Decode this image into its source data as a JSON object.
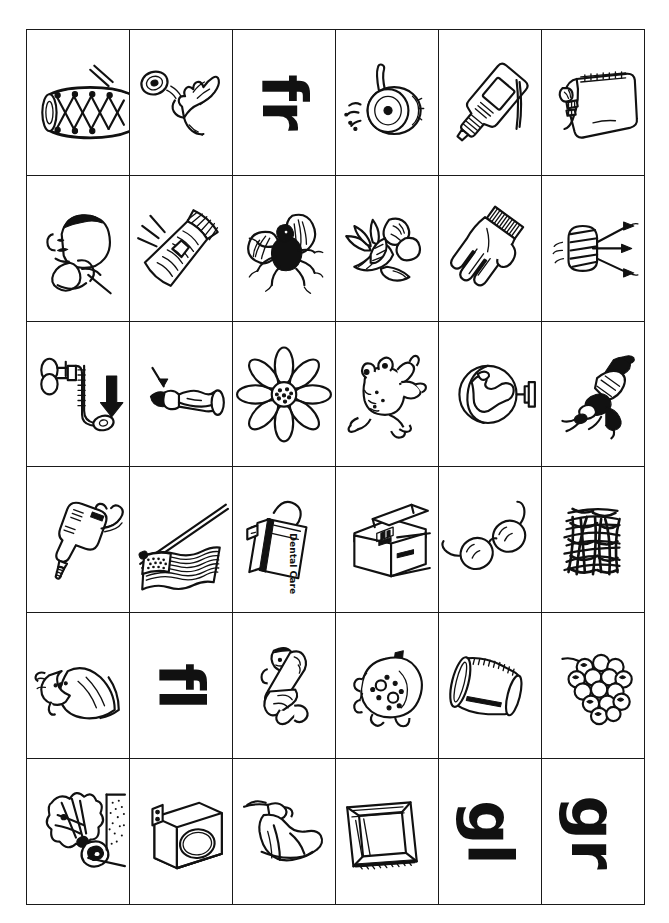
{
  "worksheet": {
    "title": "Phonics Blends Picture Card Grid",
    "columns": 6,
    "rows": 6,
    "ink_color": "#111111",
    "paper_color": "#ffffff",
    "border_color": "#1a1a1a"
  },
  "blend_labels": [
    {
      "text": "fr",
      "row": 1,
      "col": 3,
      "rotation_deg": 90
    },
    {
      "text": "fl",
      "row": 5,
      "col": 2,
      "rotation_deg": 90
    },
    {
      "text": "gl",
      "row": 6,
      "col": 5,
      "rotation_deg": 90
    },
    {
      "text": "gr",
      "row": 6,
      "col": 6,
      "rotation_deg": 90
    }
  ],
  "embedded_text": [
    {
      "text": "Dental Care",
      "location": "row 4 column 3 dental floss box",
      "rotation_deg": 90
    }
  ],
  "cells": [
    {
      "id": "r1c1",
      "row": 1,
      "col": 1,
      "kind": "picture",
      "icon": "drum-icon",
      "label": "drum"
    },
    {
      "id": "r1c2",
      "row": 1,
      "col": 2,
      "kind": "picture",
      "icon": "frisbee-throw-icon",
      "label": "frisbee"
    },
    {
      "id": "r1c3",
      "row": 1,
      "col": 3,
      "kind": "letters",
      "icon": "blend-text-fr",
      "label": "fr"
    },
    {
      "id": "r1c4",
      "row": 1,
      "col": 4,
      "kind": "picture",
      "icon": "frying-pan-icon",
      "label": "frying pan"
    },
    {
      "id": "r1c5",
      "row": 1,
      "col": 5,
      "kind": "picture",
      "icon": "glue-bottle-icon",
      "label": "glue"
    },
    {
      "id": "r1c6",
      "row": 1,
      "col": 6,
      "kind": "picture",
      "icon": "bread-loaf-bag-icon",
      "label": "bread bag"
    },
    {
      "id": "r2c1",
      "row": 2,
      "col": 1,
      "kind": "picture",
      "icon": "frown-boy-icon",
      "label": "frown"
    },
    {
      "id": "r2c2",
      "row": 2,
      "col": 2,
      "kind": "picture",
      "icon": "flashlight-icon",
      "label": "flashlight"
    },
    {
      "id": "r2c3",
      "row": 2,
      "col": 3,
      "kind": "picture",
      "icon": "fly-insect-icon",
      "label": "fly"
    },
    {
      "id": "r2c4",
      "row": 2,
      "col": 4,
      "kind": "picture",
      "icon": "fruit-bowl-icon",
      "label": "fruit"
    },
    {
      "id": "r2c5",
      "row": 2,
      "col": 5,
      "kind": "picture",
      "icon": "glove-icon",
      "label": "glove"
    },
    {
      "id": "r2c6",
      "row": 2,
      "col": 6,
      "kind": "picture",
      "icon": "grill-icon",
      "label": "grill"
    },
    {
      "id": "r3c1",
      "row": 3,
      "col": 1,
      "kind": "picture",
      "icon": "faucet-drain-icon",
      "label": "drain"
    },
    {
      "id": "r3c2",
      "row": 3,
      "col": 2,
      "kind": "picture",
      "icon": "flea-on-finger-icon",
      "label": "flea"
    },
    {
      "id": "r3c3",
      "row": 3,
      "col": 3,
      "kind": "picture",
      "icon": "flower-icon",
      "label": "flower"
    },
    {
      "id": "r3c4",
      "row": 3,
      "col": 4,
      "kind": "picture",
      "icon": "frog-icon",
      "label": "frog"
    },
    {
      "id": "r3c5",
      "row": 3,
      "col": 5,
      "kind": "picture",
      "icon": "globe-icon",
      "label": "globe"
    },
    {
      "id": "r3c6",
      "row": 3,
      "col": 6,
      "kind": "picture",
      "icon": "grasshopper-icon",
      "label": "grasshopper"
    },
    {
      "id": "r4c1",
      "row": 4,
      "col": 1,
      "kind": "picture",
      "icon": "drill-icon",
      "label": "drill"
    },
    {
      "id": "r4c2",
      "row": 4,
      "col": 2,
      "kind": "picture",
      "icon": "flag-icon",
      "label": "flag"
    },
    {
      "id": "r4c3",
      "row": 4,
      "col": 3,
      "kind": "picture",
      "icon": "dental-floss-icon",
      "label": "floss"
    },
    {
      "id": "r4c4",
      "row": 4,
      "col": 4,
      "kind": "picture",
      "icon": "freezer-box-icon",
      "label": "freezer"
    },
    {
      "id": "r4c5",
      "row": 4,
      "col": 5,
      "kind": "picture",
      "icon": "glasses-icon",
      "label": "glasses"
    },
    {
      "id": "r4c6",
      "row": 4,
      "col": 6,
      "kind": "picture",
      "icon": "grass-icon",
      "label": "grass"
    },
    {
      "id": "r5c1",
      "row": 5,
      "col": 1,
      "kind": "picture",
      "icon": "dress-gown-icon",
      "label": "gown"
    },
    {
      "id": "r5c2",
      "row": 5,
      "col": 2,
      "kind": "letters",
      "icon": "blend-text-fl",
      "label": "fl"
    },
    {
      "id": "r5c3",
      "row": 5,
      "col": 3,
      "kind": "picture",
      "icon": "person-flop-icon",
      "label": "flop"
    },
    {
      "id": "r5c4",
      "row": 5,
      "col": 4,
      "kind": "picture",
      "icon": "grapefruit-icon",
      "label": "grapefruit"
    },
    {
      "id": "r5c5",
      "row": 5,
      "col": 5,
      "kind": "picture",
      "icon": "drinking-glass-icon",
      "label": "glass"
    },
    {
      "id": "r5c6",
      "row": 5,
      "col": 6,
      "kind": "picture",
      "icon": "grapes-icon",
      "label": "grapes"
    },
    {
      "id": "r6c1",
      "row": 6,
      "col": 1,
      "kind": "picture",
      "icon": "firecracker-icon",
      "label": "firecracker"
    },
    {
      "id": "r6c2",
      "row": 6,
      "col": 2,
      "kind": "picture",
      "icon": "dryer-machine-icon",
      "label": "dryer"
    },
    {
      "id": "r6c3",
      "row": 6,
      "col": 3,
      "kind": "picture",
      "icon": "flag-cloth-hand-icon",
      "label": "cloth"
    },
    {
      "id": "r6c4",
      "row": 6,
      "col": 4,
      "kind": "picture",
      "icon": "picture-frame-icon",
      "label": "frame"
    },
    {
      "id": "r6c5",
      "row": 6,
      "col": 5,
      "kind": "letters",
      "icon": "blend-text-gl",
      "label": "gl"
    },
    {
      "id": "r6c6",
      "row": 6,
      "col": 6,
      "kind": "letters",
      "icon": "blend-text-gr",
      "label": "gr"
    }
  ]
}
